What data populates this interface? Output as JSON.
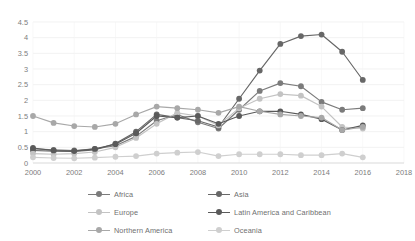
{
  "chart_data": {
    "type": "line",
    "title": "",
    "xlabel": "",
    "ylabel": "",
    "x": [
      2000,
      2001,
      2002,
      2003,
      2004,
      2005,
      2006,
      2007,
      2008,
      2009,
      2010,
      2011,
      2012,
      2013,
      2014,
      2015,
      2016
    ],
    "xlim": [
      2000,
      2018
    ],
    "ylim": [
      0,
      4.5
    ],
    "xticks": [
      "2000",
      "2002",
      "2004",
      "2006",
      "2008",
      "2010",
      "2012",
      "2014",
      "2016",
      "2018"
    ],
    "yticks": [
      "0",
      "0.5",
      "1",
      "1.5",
      "2",
      "2.5",
      "3",
      "3.5",
      "4",
      "4.5"
    ],
    "grid": true,
    "legend_position": "bottom",
    "series": [
      {
        "name": "Africa",
        "color": "#7b7b7b",
        "values": [
          0.45,
          0.42,
          0.4,
          0.45,
          0.55,
          0.85,
          1.35,
          1.55,
          1.3,
          1.1,
          1.7,
          2.3,
          2.55,
          2.45,
          1.95,
          1.7,
          1.75
        ]
      },
      {
        "name": "Asia",
        "color": "#676767",
        "values": [
          0.4,
          0.38,
          0.37,
          0.42,
          0.62,
          1.0,
          1.55,
          1.45,
          1.35,
          1.15,
          2.05,
          2.95,
          3.8,
          4.05,
          4.1,
          3.55,
          2.65
        ]
      },
      {
        "name": "Europe",
        "color": "#c3c3c3",
        "values": [
          0.3,
          0.28,
          0.3,
          0.35,
          0.5,
          0.8,
          1.25,
          1.6,
          1.5,
          1.2,
          1.75,
          2.05,
          2.2,
          2.15,
          1.8,
          1.15,
          1.1
        ]
      },
      {
        "name": "Latin America and Caribbean",
        "color": "#5a5a5a",
        "values": [
          0.48,
          0.4,
          0.38,
          0.45,
          0.6,
          0.95,
          1.5,
          1.45,
          1.5,
          1.25,
          1.5,
          1.65,
          1.65,
          1.55,
          1.4,
          1.05,
          1.2
        ]
      },
      {
        "name": "Northern America",
        "color": "#a8a8a8",
        "values": [
          1.5,
          1.28,
          1.18,
          1.15,
          1.25,
          1.55,
          1.8,
          1.75,
          1.7,
          1.6,
          1.8,
          1.65,
          1.55,
          1.5,
          1.45,
          1.05,
          1.15
        ]
      },
      {
        "name": "Oceania",
        "color": "#cfcfcf",
        "values": [
          0.18,
          0.16,
          0.15,
          0.17,
          0.2,
          0.22,
          0.3,
          0.33,
          0.35,
          0.22,
          0.28,
          0.28,
          0.28,
          0.25,
          0.25,
          0.3,
          0.18
        ]
      }
    ]
  }
}
